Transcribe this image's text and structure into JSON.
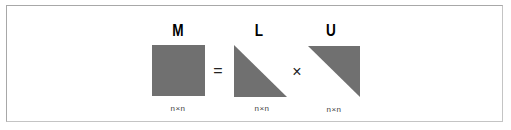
{
  "diagram": {
    "equation": "M = L × U",
    "matrices": [
      {
        "name": "M",
        "shape": "full-square",
        "dimension": "n×n"
      },
      {
        "name": "L",
        "shape": "lower-triangular",
        "dimension": "n×n"
      },
      {
        "name": "U",
        "shape": "upper-triangular",
        "dimension": "n×n"
      }
    ],
    "operators": {
      "equals": "=",
      "times": "×"
    },
    "colors": {
      "fill": "#707070",
      "border": "#a8a8a8"
    }
  }
}
